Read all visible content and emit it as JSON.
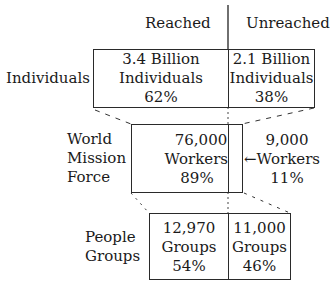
{
  "headers": {
    "reached": "Reached",
    "unreached": "Unreached"
  },
  "rows": [
    {
      "label": "Individuals",
      "reached": {
        "line1": "3.4 Billion",
        "line2": "Individuals",
        "pct": "62%"
      },
      "unreached": {
        "line1": "2.1 Billion",
        "line2": "Individuals",
        "pct": "38%"
      }
    },
    {
      "label_lines": [
        "World",
        "Mission",
        "Force"
      ],
      "reached": {
        "line1": "76,000",
        "line2": "Workers",
        "pct": "89%"
      },
      "unreached": {
        "line1": "9,000",
        "line2": "←Workers",
        "pct": "11%"
      }
    },
    {
      "label_lines": [
        "People",
        "Groups"
      ],
      "reached": {
        "line1": "12,970",
        "line2": "Groups",
        "pct": "54%"
      },
      "unreached": {
        "line1": "11,000",
        "line2": "Groups",
        "pct": "46%"
      }
    }
  ]
}
